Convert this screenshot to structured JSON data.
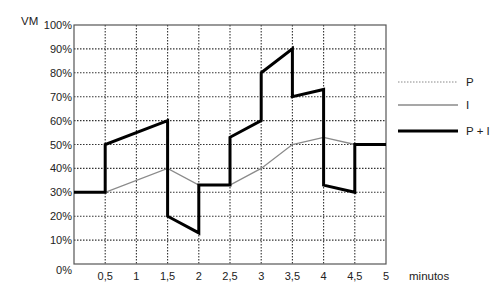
{
  "chart_data": {
    "type": "line",
    "title": "",
    "xlabel": "minutos",
    "ylabel": "VM",
    "xlim": [
      0,
      5
    ],
    "ylim": [
      0,
      100
    ],
    "grid": true,
    "legend_position": "right",
    "x_ticks": [
      {
        "value": 0.5,
        "label": "0,5"
      },
      {
        "value": 1,
        "label": "1"
      },
      {
        "value": 1.5,
        "label": "1,5"
      },
      {
        "value": 2,
        "label": "2"
      },
      {
        "value": 2.5,
        "label": "2,5"
      },
      {
        "value": 3,
        "label": "3"
      },
      {
        "value": 3.5,
        "label": "3,5"
      },
      {
        "value": 4,
        "label": "4"
      },
      {
        "value": 4.5,
        "label": "4,5"
      },
      {
        "value": 5,
        "label": "5"
      }
    ],
    "y_ticks": [
      {
        "value": 0,
        "label": "0%"
      },
      {
        "value": 10,
        "label": "10%"
      },
      {
        "value": 20,
        "label": "20%"
      },
      {
        "value": 30,
        "label": "30%"
      },
      {
        "value": 40,
        "label": "40%"
      },
      {
        "value": 50,
        "label": "50%"
      },
      {
        "value": 60,
        "label": "60%"
      },
      {
        "value": 70,
        "label": "70%"
      },
      {
        "value": 80,
        "label": "80%"
      },
      {
        "value": 90,
        "label": "90%"
      },
      {
        "value": 100,
        "label": "100%"
      }
    ],
    "series": [
      {
        "name": "P",
        "style": "dotted",
        "color": "#888888",
        "points": []
      },
      {
        "name": "I",
        "style": "solid-thin",
        "color": "#8a8a8a",
        "points": [
          [
            0,
            30
          ],
          [
            0.5,
            30
          ],
          [
            1.5,
            40
          ],
          [
            2,
            33
          ],
          [
            2.5,
            33
          ],
          [
            3,
            40
          ],
          [
            3.5,
            50
          ],
          [
            4,
            53
          ],
          [
            4.5,
            50
          ],
          [
            5,
            50
          ]
        ]
      },
      {
        "name": "P + I",
        "style": "solid-thick",
        "color": "#000000",
        "points": [
          [
            0,
            30
          ],
          [
            0.5,
            30
          ],
          [
            0.5,
            50
          ],
          [
            1.5,
            60
          ],
          [
            1.5,
            20
          ],
          [
            2,
            13
          ],
          [
            2,
            33
          ],
          [
            2.5,
            33
          ],
          [
            2.5,
            53
          ],
          [
            3,
            60
          ],
          [
            3,
            80
          ],
          [
            3.5,
            90
          ],
          [
            3.5,
            70
          ],
          [
            4,
            73
          ],
          [
            4,
            33
          ],
          [
            4.5,
            30
          ],
          [
            4.5,
            50
          ],
          [
            5,
            50
          ]
        ]
      }
    ]
  },
  "labels": {
    "y_axis_title": "VM",
    "x_axis_title": "minutos",
    "legend": [
      "P",
      "I",
      "P + I"
    ]
  }
}
